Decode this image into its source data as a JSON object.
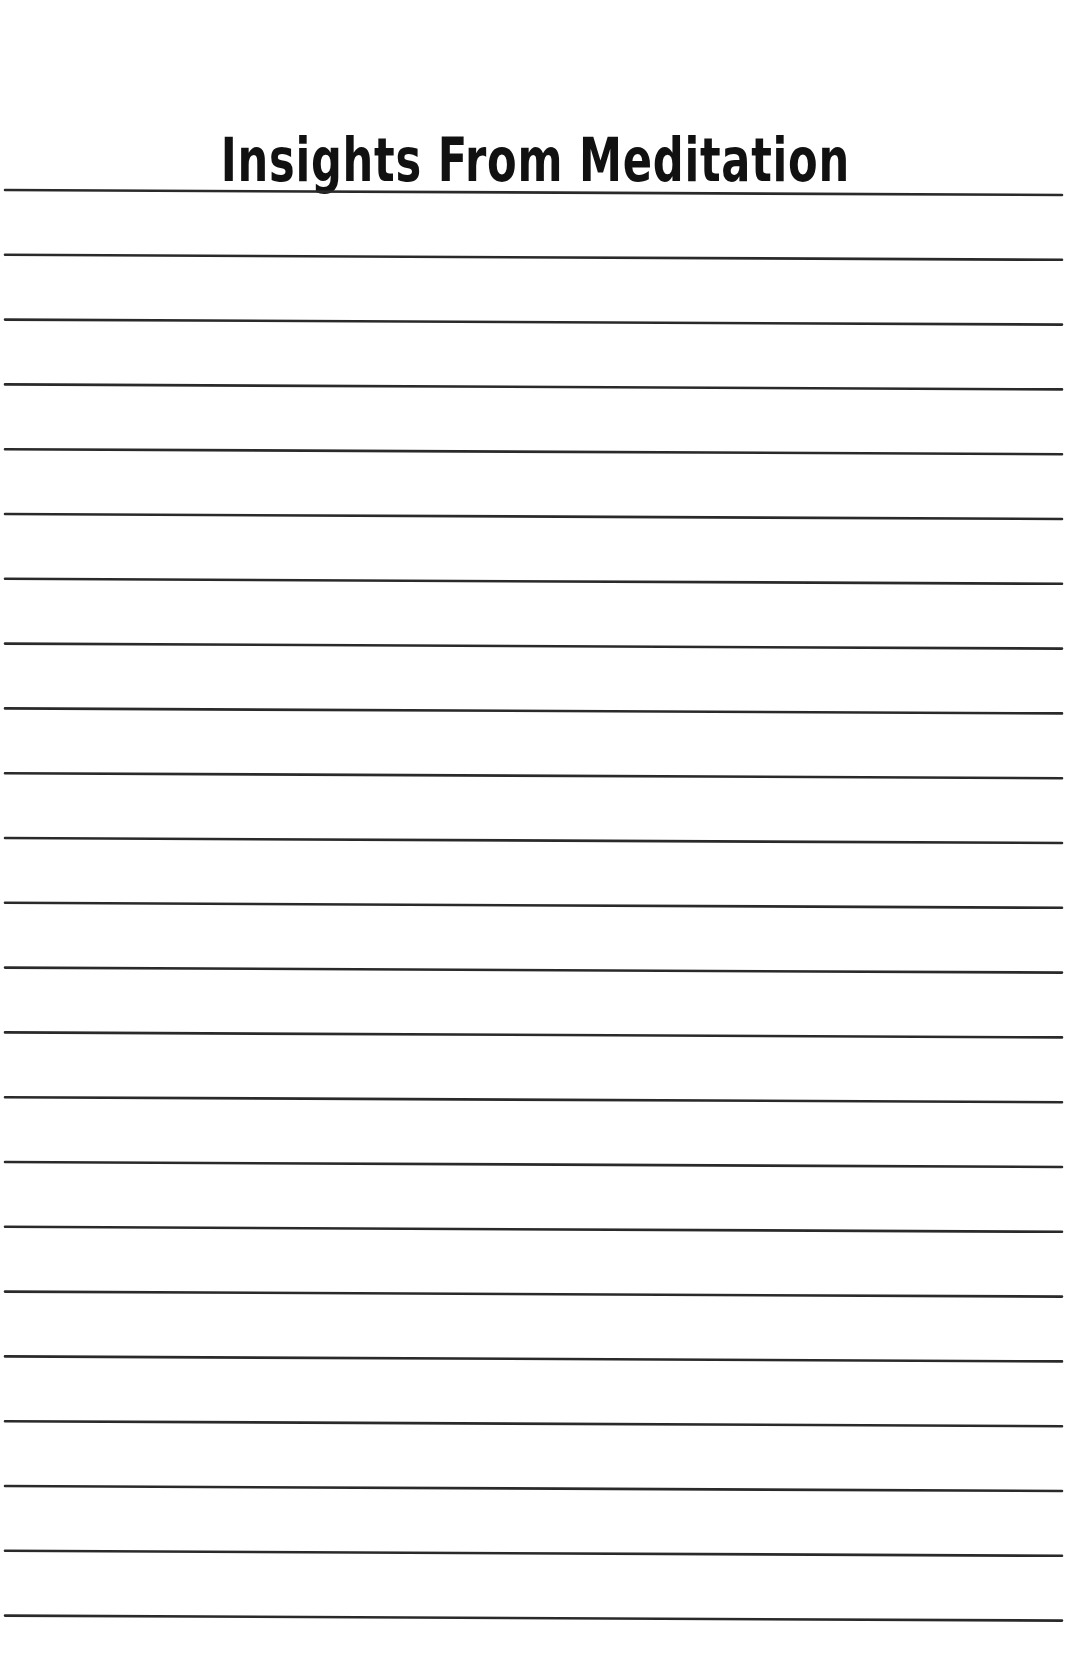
{
  "page": {
    "title": "Insights From Meditation",
    "line_color": "#2a2a2a",
    "background": "#ffffff",
    "ruled_lines": {
      "count": 23,
      "first_y": 192,
      "spacing": 64.8,
      "x_start": 5,
      "x_end": 1062,
      "left_offset": -2,
      "right_offset": 3,
      "thickness": 2.6
    }
  }
}
